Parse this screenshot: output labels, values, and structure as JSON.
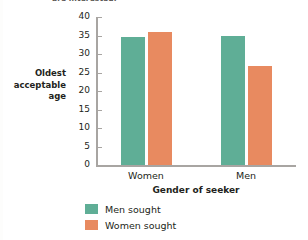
{
  "chart_data": {
    "type": "bar",
    "title": "are interested.",
    "categories": [
      "Women",
      "Men"
    ],
    "series": [
      {
        "name": "Men sought",
        "color": "#5fae96",
        "values": [
          34.5,
          35.0
        ]
      },
      {
        "name": "Women sought",
        "color": "#e88a60",
        "values": [
          36.0,
          26.7
        ]
      }
    ],
    "xlabel": "Gender of seeker",
    "ylabel": "Oldest acceptable age",
    "ylabel_lines": [
      "Oldest",
      "acceptable",
      "age"
    ],
    "ylim": [
      0,
      40
    ],
    "ytick_values": [
      40,
      35,
      30,
      25,
      20,
      15,
      10,
      5,
      0
    ],
    "ytick_labels": [
      "40",
      "35",
      "30",
      "25",
      "20",
      "15",
      "10",
      "5",
      "0"
    ],
    "grid": false,
    "legend_position": "bottom-left",
    "axis_color": "#a8a5a2"
  }
}
